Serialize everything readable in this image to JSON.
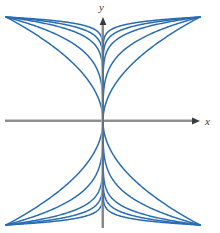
{
  "figure": {
    "background_color": "#ffffff"
  },
  "axes": {
    "x_label": "x",
    "y_label": "y",
    "color": "#6e6e6e",
    "highlight_color": "#b4b4b4",
    "line_width": 1.6,
    "origin": {
      "x": 103,
      "y": 121
    },
    "x_axis": {
      "start_x": 5,
      "end_x": 200,
      "y": 121,
      "arrow": "right"
    },
    "y_axis": {
      "x": 103,
      "start_y": 228,
      "end_y": 17,
      "arrow": "up"
    },
    "ticks": [],
    "grid": false
  },
  "chart_data": {
    "type": "line",
    "title": "",
    "subtitle": "",
    "xlabel": "x",
    "ylabel": "y",
    "xlim": [
      -1.05,
      1.05
    ],
    "ylim": [
      -1.15,
      1.15
    ],
    "grid": false,
    "legend": null,
    "legend_position": "none",
    "annotations": [],
    "tick_labels": {
      "x": [],
      "y": []
    },
    "curve_color": "#2a6cb4",
    "curve_width": 1.5,
    "symmetry": [
      "x-axis",
      "y-axis"
    ],
    "curve_count_per_quadrant": 5,
    "curve_count_total": 20,
    "series": [
      {
        "name": "n = 2",
        "exponent": 0.5,
        "values": []
      },
      {
        "name": "n = 4",
        "exponent": 0.25,
        "values": []
      },
      {
        "name": "n = 8",
        "exponent": 0.125,
        "values": []
      },
      {
        "name": "n = 16",
        "exponent": 0.08,
        "values": []
      },
      {
        "name": "n = 32",
        "exponent": 0.052,
        "values": []
      }
    ],
    "x_samples": [
      0,
      0.02,
      0.05,
      0.1,
      0.2,
      0.3,
      0.4,
      0.5,
      0.6,
      0.7,
      0.8,
      0.9,
      1.0
    ]
  }
}
